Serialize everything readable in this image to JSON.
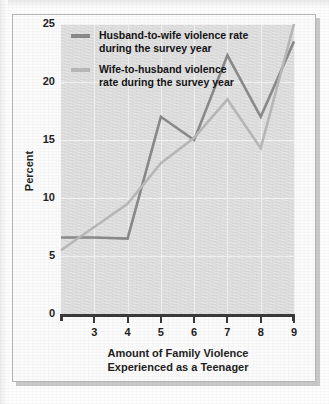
{
  "figure": {
    "y_axis_title": "Percent",
    "x_axis_title_line1": "Amount of Family Violence",
    "x_axis_title_line2": "Experienced as a Teenager"
  },
  "legend": {
    "position": "inside-top-left",
    "entries": [
      {
        "name": "husband-to-wife",
        "label": "Husband-to-wife violence rate\nduring the survey year",
        "color": "#8a8a8a"
      },
      {
        "name": "wife-to-husband",
        "label": "Wife-to-husband violence\nrate during the survey year",
        "color": "#b8b8b8"
      }
    ]
  },
  "chart_data": {
    "type": "line",
    "title": "",
    "subtitle": "",
    "xlabel": "Amount of Family Violence Experienced as a Teenager",
    "ylabel": "Percent",
    "x": [
      2,
      3,
      4,
      5,
      6,
      7,
      8,
      9
    ],
    "xlim": [
      2,
      9
    ],
    "ylim": [
      0,
      25
    ],
    "xticks": [
      3,
      4,
      5,
      6,
      7,
      8,
      9
    ],
    "xticklabels": [
      "3",
      "4",
      "5",
      "6",
      "7",
      "8",
      "9"
    ],
    "yticks": [
      0,
      5,
      10,
      15,
      20,
      25
    ],
    "yticklabels": [
      "0",
      "5",
      "10",
      "15",
      "20",
      "25"
    ],
    "grid": true,
    "series": [
      {
        "name": "Husband-to-wife violence rate during the survey year",
        "color": "#8a8a8a",
        "values": [
          6.6,
          6.6,
          6.5,
          17.0,
          15.0,
          22.3,
          17.0,
          23.5
        ]
      },
      {
        "name": "Wife-to-husband violence rate during the survey year",
        "color": "#b8b8b8",
        "values": [
          5.5,
          7.5,
          9.5,
          13.0,
          15.2,
          18.5,
          14.3,
          25.0
        ]
      }
    ]
  }
}
